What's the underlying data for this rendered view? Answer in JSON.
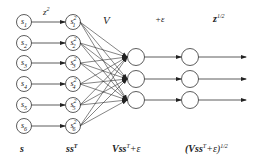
{
  "diagram": {
    "top_labels": {
      "square_op": "z",
      "square_op_exp": "2",
      "weights": "V",
      "add_eps": "+ε",
      "sqrt_op": "z",
      "sqrt_op_exp": "1/2"
    },
    "bottom_labels": {
      "input": "s",
      "outer_product": "ss",
      "outer_product_exp": "T",
      "linear": "Vss",
      "linear_exp": "T",
      "linear_suffix": "+ε",
      "sqrt_open": "(Vss",
      "sqrt_exp_T": "T",
      "sqrt_mid": "+ε)",
      "sqrt_exp": "1/2"
    },
    "input_nodes": [
      {
        "base": "s",
        "sub": "1"
      },
      {
        "base": "s",
        "sub": "2"
      },
      {
        "base": "s",
        "sub": "3"
      },
      {
        "base": "s",
        "sub": "4"
      },
      {
        "base": "s",
        "sub": "5"
      },
      {
        "base": "s",
        "sub": "6"
      }
    ],
    "square_nodes": [
      {
        "base": "s",
        "sub": "1",
        "sup": "2"
      },
      {
        "base": "s",
        "sub": "2",
        "sup": "2"
      },
      {
        "base": "s",
        "sub": "3",
        "sup": "2"
      },
      {
        "base": "s",
        "sub": "4",
        "sup": "2"
      },
      {
        "base": "s",
        "sub": "5",
        "sup": "2"
      },
      {
        "base": "s",
        "sub": "6",
        "sup": "2"
      }
    ],
    "hidden_node_count": 3,
    "output_node_count": 3,
    "colors": {
      "stroke": "#333333",
      "background": "#ffffff"
    }
  }
}
